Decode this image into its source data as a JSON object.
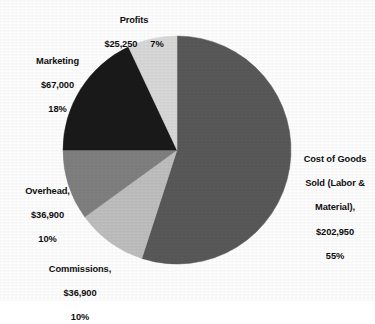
{
  "chart_data": {
    "type": "pie",
    "title": "",
    "legend_position": "none",
    "labels_position": "outside",
    "start_angle_deg": 0,
    "direction": "clockwise",
    "center": {
      "x": 177,
      "y": 150
    },
    "radius": 114,
    "total_value": 369000,
    "currency_symbol": "$",
    "categories": [
      "Cost of Goods Sold (Labor & Material)",
      "Commissions",
      "Overhead",
      "Marketing",
      "Profits"
    ],
    "values": [
      202950,
      36900,
      36900,
      67000,
      25250
    ],
    "percentages": [
      55,
      10,
      10,
      18,
      7
    ],
    "colors": [
      "#595959",
      "#bfbfbf",
      "#808080",
      "#1a1a1a",
      "#d9d9d9"
    ],
    "slices": [
      {
        "name": "Cost of Goods Sold (Labor & Material)",
        "value": 202950,
        "value_text": "$202,950",
        "percent": 55,
        "percent_text": "55%",
        "color": "#595959",
        "start_angle_deg": 0,
        "end_angle_deg": 198
      },
      {
        "name": "Commissions",
        "value": 36900,
        "value_text": "$36,900",
        "percent": 10,
        "percent_text": "10%",
        "color": "#bfbfbf",
        "start_angle_deg": 198,
        "end_angle_deg": 234
      },
      {
        "name": "Overhead",
        "value": 36900,
        "value_text": "$36,900",
        "percent": 10,
        "percent_text": "10%",
        "color": "#808080",
        "start_angle_deg": 234,
        "end_angle_deg": 270
      },
      {
        "name": "Marketing",
        "value": 67000,
        "value_text": "$67,000",
        "percent": 18,
        "percent_text": "18%",
        "color": "#1a1a1a",
        "start_angle_deg": 270,
        "end_angle_deg": 334.8
      },
      {
        "name": "Profits",
        "value": 25250,
        "value_text": "$25,250",
        "percent": 7,
        "percent_text": "7%",
        "color": "#d9d9d9",
        "start_angle_deg": 334.8,
        "end_angle_deg": 360
      }
    ]
  },
  "labels": {
    "profits": {
      "name": "Profits",
      "value_text": "$25,250",
      "percent_text": "7%"
    },
    "marketing": {
      "line1": "Marketing",
      "line2": "$67,000",
      "line3": "18%"
    },
    "overhead": {
      "line1": "Overhead,",
      "line2": "$36,900",
      "line3": "10%"
    },
    "commissions": {
      "line1": "Commissions,",
      "line2": "$36,900",
      "line3": "10%"
    },
    "cogs": {
      "line1": "Cost of Goods",
      "line2": "Sold (Labor &",
      "line3": "Material),",
      "line4": "$202,950",
      "line5": "55%"
    }
  }
}
